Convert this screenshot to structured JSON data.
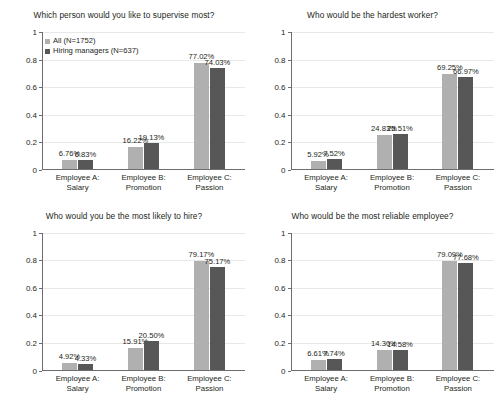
{
  "figure": {
    "background": "#ffffff",
    "series_colors": [
      "#b0b0b0",
      "#575757"
    ]
  },
  "legend": {
    "position": "top-left of first panel",
    "entries": [
      {
        "label": "All (N=1752)",
        "color": "#b0b0b0"
      },
      {
        "label": "Hiring managers (N=637)",
        "color": "#575757"
      }
    ]
  },
  "axis": {
    "yticks": [
      "0",
      "0.2",
      "0.4",
      "0.6",
      "0.8",
      "1"
    ],
    "ytick_values": [
      0,
      0.2,
      0.4,
      0.6,
      0.8,
      1
    ],
    "categories": [
      "Employee A: Salary",
      "Employee B:\nPromotion",
      "Employee C: Passion"
    ]
  },
  "chart_data": [
    {
      "type": "bar",
      "title": "Which person would you like to supervise most?",
      "xlabel": "",
      "ylabel": "",
      "ylim": [
        0,
        1
      ],
      "grid": true,
      "legend_position": "upper left",
      "categories": [
        "Employee A: Salary",
        "Employee B: Promotion",
        "Employee C: Passion"
      ],
      "series": [
        {
          "name": "All (N=1752)",
          "color": "#b0b0b0",
          "values": [
            0.0676,
            0.1622,
            0.7702
          ],
          "labels": [
            "6.76%",
            "16.22%",
            "77.02%"
          ]
        },
        {
          "name": "Hiring managers (N=637)",
          "color": "#575757",
          "values": [
            0.0683,
            0.1913,
            0.7403
          ],
          "labels": [
            "6.83%",
            "19.13%",
            "74.03%"
          ]
        }
      ]
    },
    {
      "type": "bar",
      "title": "Who would be the hardest worker?",
      "xlabel": "",
      "ylabel": "",
      "ylim": [
        0,
        1
      ],
      "grid": true,
      "legend_position": "none",
      "categories": [
        "Employee A: Salary",
        "Employee B: Promotion",
        "Employee C: Passion"
      ],
      "series": [
        {
          "name": "All (N=1752)",
          "color": "#b0b0b0",
          "values": [
            0.0592,
            0.2483,
            0.6925
          ],
          "labels": [
            "5.92%",
            "24.83%",
            "69.25%"
          ]
        },
        {
          "name": "Hiring managers (N=637)",
          "color": "#575757",
          "values": [
            0.0752,
            0.2551,
            0.6697
          ],
          "labels": [
            "7.52%",
            "25.51%",
            "66.97%"
          ]
        }
      ]
    },
    {
      "type": "bar",
      "title": "Who would you be the most likely to hire?",
      "xlabel": "",
      "ylabel": "",
      "ylim": [
        0,
        1
      ],
      "grid": true,
      "legend_position": "none",
      "categories": [
        "Employee A: Salary",
        "Employee B: Promotion",
        "Employee C: Passion"
      ],
      "series": [
        {
          "name": "All (N=1752)",
          "color": "#b0b0b0",
          "values": [
            0.0492,
            0.1591,
            0.7917
          ],
          "labels": [
            "4.92%",
            "15.91%",
            "79.17%"
          ]
        },
        {
          "name": "Hiring managers (N=637)",
          "color": "#575757",
          "values": [
            0.0433,
            0.205,
            0.7517
          ],
          "labels": [
            "4.33%",
            "20.50%",
            "75.17%"
          ]
        }
      ]
    },
    {
      "type": "bar",
      "title": "Who would be the most reliable employee?",
      "xlabel": "",
      "ylabel": "",
      "ylim": [
        0,
        1
      ],
      "grid": true,
      "legend_position": "none",
      "categories": [
        "Employee A: Salary",
        "Employee B: Promotion",
        "Employee C: Passion"
      ],
      "series": [
        {
          "name": "All (N=1752)",
          "color": "#b0b0b0",
          "values": [
            0.0661,
            0.143,
            0.7909
          ],
          "labels": [
            "6.61%",
            "14.30%",
            "79.09%"
          ]
        },
        {
          "name": "Hiring managers (N=637)",
          "color": "#575757",
          "values": [
            0.0774,
            0.1458,
            0.7768
          ],
          "labels": [
            "7.74%",
            "14.58%",
            "77.68%"
          ]
        }
      ]
    }
  ]
}
